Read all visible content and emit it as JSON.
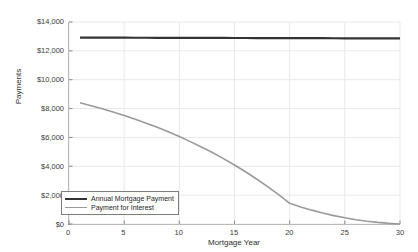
{
  "chart_data": {
    "type": "line",
    "title": "",
    "xlabel": "Mortgage Year",
    "ylabel": "Payments",
    "xlim": [
      0,
      30
    ],
    "ylim": [
      0,
      14000
    ],
    "xticks": [
      0,
      5,
      10,
      15,
      20,
      25,
      30
    ],
    "xtick_labels": [
      "0",
      "5",
      "10",
      "15",
      "20",
      "25",
      "30"
    ],
    "yticks": [
      0,
      2000,
      4000,
      6000,
      8000,
      10000,
      12000,
      14000
    ],
    "ytick_labels": [
      "$0",
      "$2,000",
      "$4,000",
      "$6,000",
      "$8,000",
      "$10,000",
      "$12,000",
      "$14,000"
    ],
    "grid": true,
    "legend_position": "lower left",
    "series": [
      {
        "name": "Annual Mortgage Payment",
        "color": "#333333",
        "width": 2.2,
        "x": [
          1,
          2,
          3,
          4,
          5,
          6,
          7,
          8,
          9,
          10,
          11,
          12,
          13,
          14,
          15,
          16,
          17,
          18,
          19,
          20,
          21,
          22,
          23,
          24,
          25,
          26,
          27,
          28,
          29,
          30
        ],
        "values": [
          12920,
          12918,
          12916,
          12914,
          12912,
          12910,
          12908,
          12906,
          12904,
          12902,
          12900,
          12898,
          12896,
          12894,
          12892,
          12890,
          12888,
          12886,
          12884,
          12882,
          12880,
          12878,
          12876,
          12874,
          12872,
          12870,
          12868,
          12866,
          12864,
          12862
        ]
      },
      {
        "name": "Payment for Interest",
        "color": "#9a9a9a",
        "width": 1.6,
        "x": [
          1,
          2,
          3,
          4,
          5,
          6,
          7,
          8,
          9,
          10,
          11,
          12,
          13,
          14,
          15,
          16,
          17,
          18,
          19,
          20,
          21,
          22,
          23,
          24,
          25,
          26,
          27,
          28,
          29,
          30
        ],
        "values": [
          8400,
          8200,
          7990,
          7760,
          7520,
          7260,
          6990,
          6700,
          6390,
          6060,
          5710,
          5340,
          4950,
          4530,
          4090,
          3620,
          3120,
          2590,
          2030,
          1430,
          1180,
          960,
          760,
          580,
          430,
          300,
          195,
          110,
          45,
          0
        ]
      }
    ]
  },
  "legend": {
    "items": [
      {
        "label": "Annual Mortgage Payment"
      },
      {
        "label": "Payment for Interest"
      }
    ]
  }
}
